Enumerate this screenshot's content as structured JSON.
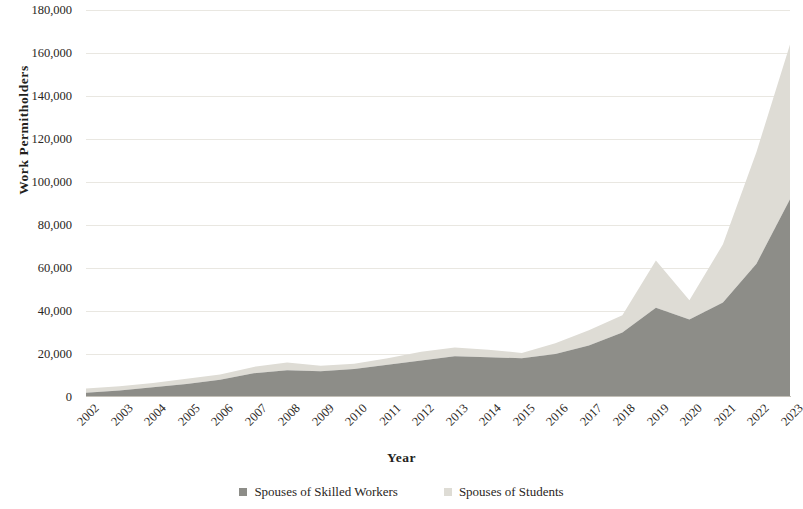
{
  "chart_data": {
    "type": "area",
    "stacked": true,
    "title": "",
    "xlabel": "Year",
    "ylabel": "Work Permitholders",
    "categories": [
      "2002",
      "2003",
      "2004",
      "2005",
      "2006",
      "2007",
      "2008",
      "2009",
      "2010",
      "2011",
      "2012",
      "2013",
      "2014",
      "2015",
      "2016",
      "2017",
      "2018",
      "2019",
      "2020",
      "2021",
      "2022",
      "2023"
    ],
    "series": [
      {
        "name": "Spouses of Skilled Workers",
        "color": "#8d8d88",
        "values": [
          2000,
          3000,
          4500,
          6000,
          8000,
          11000,
          12500,
          12000,
          13000,
          15000,
          17000,
          19000,
          18500,
          18000,
          20000,
          24000,
          30000,
          41500,
          36000,
          44000,
          62000,
          92000
        ]
      },
      {
        "name": "Spouses of Students",
        "color": "#dedcd5",
        "values": [
          2000,
          2000,
          2000,
          2500,
          2500,
          3000,
          3500,
          2500,
          2500,
          3000,
          4000,
          4000,
          3500,
          2500,
          5000,
          7000,
          8000,
          22000,
          9000,
          27000,
          52000,
          72000
        ]
      }
    ],
    "totals": [
      4000,
      5000,
      6500,
      8500,
      10500,
      14000,
      16000,
      14500,
      15500,
      18000,
      21000,
      23000,
      22000,
      20500,
      25000,
      31000,
      38000,
      63500,
      45000,
      71000,
      114000,
      164000
    ],
    "ylim": [
      0,
      180000
    ],
    "yticks": [
      0,
      20000,
      40000,
      60000,
      80000,
      100000,
      120000,
      140000,
      160000,
      180000
    ],
    "ytick_labels": [
      "0",
      "20,000",
      "40,000",
      "60,000",
      "80,000",
      "100,000",
      "120,000",
      "140,000",
      "160,000",
      "180,000"
    ],
    "grid": true,
    "legend_position": "bottom"
  },
  "axes": {
    "y_title": "Work Permitholders",
    "x_title": "Year"
  },
  "legend": {
    "items": [
      {
        "label": "Spouses of Skilled Workers",
        "color": "#8d8d88"
      },
      {
        "label": "Spouses of Students",
        "color": "#dedcd5"
      }
    ]
  },
  "colors": {
    "skilled_workers": "#8d8d88",
    "students": "#dedcd5",
    "gridline": "#e9e7e1",
    "text": "#231f1c",
    "background": "#ffffff"
  }
}
